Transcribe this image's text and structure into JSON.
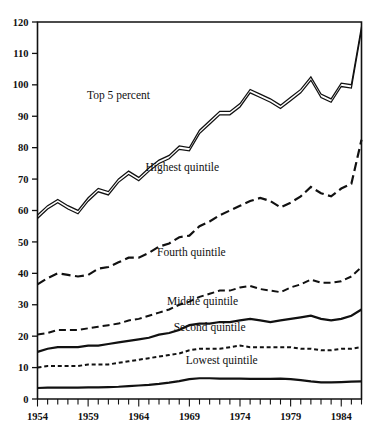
{
  "chart_data": {
    "type": "line",
    "title": "",
    "subtitle": "",
    "xlabel": "",
    "ylabel": "",
    "xlim": [
      1954,
      1986
    ],
    "ylim": [
      0,
      120
    ],
    "ytick_values": [
      0,
      10,
      20,
      30,
      40,
      50,
      60,
      70,
      80,
      90,
      100,
      110,
      120
    ],
    "ytick_labels": [
      "0",
      "10",
      "20",
      "30",
      "40",
      "50",
      "60",
      "70",
      "80",
      "90",
      "100",
      "110",
      "120"
    ],
    "xtick_values": [
      1954,
      1959,
      1964,
      1969,
      1974,
      1979,
      1984
    ],
    "xtick_labels": [
      "1954",
      "1959",
      "1964",
      "1969",
      "1974",
      "1979",
      "1984"
    ],
    "xtick_minor_every": 1,
    "grid": false,
    "legend_position": "inline-annotations",
    "x": [
      1954,
      1955,
      1956,
      1957,
      1958,
      1959,
      1960,
      1961,
      1962,
      1963,
      1964,
      1965,
      1966,
      1967,
      1968,
      1969,
      1970,
      1971,
      1972,
      1973,
      1974,
      1975,
      1976,
      1977,
      1978,
      1979,
      1980,
      1981,
      1982,
      1983,
      1984,
      1985,
      1986
    ],
    "series": [
      {
        "name": "Top 5 percent",
        "style": "double-solid",
        "label_x": 1962.0,
        "label_y": 95.5,
        "values": [
          58.0,
          61.0,
          63.0,
          61.0,
          59.5,
          63.5,
          66.5,
          65.5,
          69.5,
          72.0,
          70.0,
          73.0,
          75.5,
          77.0,
          80.0,
          79.5,
          85.0,
          88.0,
          91.0,
          91.0,
          93.5,
          98.0,
          96.5,
          95.0,
          93.0,
          95.5,
          98.0,
          102.0,
          96.5,
          95.0,
          100.0,
          99.5,
          118.0
        ]
      },
      {
        "name": "Highest quintile",
        "style": "long-dash",
        "label_x": 1968.3,
        "label_y": 72.5,
        "values": [
          36.5,
          38.5,
          40.0,
          39.5,
          39.0,
          39.5,
          41.5,
          42.0,
          43.5,
          45.0,
          45.0,
          46.5,
          48.5,
          49.5,
          51.5,
          52.0,
          55.0,
          56.5,
          58.5,
          60.0,
          61.5,
          63.0,
          64.0,
          63.0,
          61.0,
          62.5,
          64.5,
          67.5,
          65.5,
          64.5,
          67.0,
          68.5,
          82.5
        ]
      },
      {
        "name": "Fourth quintile",
        "style": "medium-dash",
        "label_x": 1969.2,
        "label_y": 45.5,
        "values": [
          20.5,
          21.0,
          22.0,
          22.0,
          22.0,
          22.5,
          23.0,
          23.5,
          24.0,
          25.0,
          25.5,
          26.5,
          27.5,
          28.5,
          30.0,
          31.0,
          32.5,
          33.5,
          34.5,
          34.5,
          35.5,
          36.0,
          35.0,
          34.5,
          34.0,
          35.5,
          36.5,
          38.0,
          37.0,
          37.0,
          37.5,
          39.0,
          42.0
        ]
      },
      {
        "name": "Middle quintile",
        "style": "solid",
        "label_x": 1970.3,
        "label_y": 30.0,
        "values": [
          15.0,
          16.0,
          16.5,
          16.5,
          16.5,
          17.0,
          17.0,
          17.5,
          18.0,
          18.5,
          19.0,
          19.5,
          20.5,
          21.0,
          22.0,
          23.5,
          24.0,
          24.0,
          24.5,
          24.5,
          25.0,
          25.5,
          25.0,
          24.5,
          25.0,
          25.5,
          26.0,
          26.5,
          25.5,
          25.0,
          25.5,
          26.5,
          28.5
        ]
      },
      {
        "name": "Second quintile",
        "style": "short-dash",
        "label_x": 1971.0,
        "label_y": 21.5,
        "values": [
          10.0,
          10.5,
          10.5,
          10.5,
          10.5,
          11.0,
          11.0,
          11.0,
          11.5,
          12.0,
          12.5,
          13.0,
          13.5,
          14.0,
          14.5,
          15.5,
          16.0,
          16.0,
          16.0,
          16.5,
          17.0,
          16.5,
          16.5,
          16.5,
          16.5,
          16.5,
          16.0,
          16.0,
          15.5,
          15.5,
          16.0,
          16.0,
          16.5
        ]
      },
      {
        "name": "Lowest quintile",
        "style": "solid",
        "label_x": 1972.2,
        "label_y": 11.0,
        "values": [
          3.5,
          3.6,
          3.6,
          3.6,
          3.6,
          3.7,
          3.7,
          3.8,
          3.9,
          4.1,
          4.3,
          4.5,
          4.8,
          5.2,
          5.7,
          6.3,
          6.6,
          6.6,
          6.5,
          6.5,
          6.5,
          6.4,
          6.4,
          6.4,
          6.5,
          6.3,
          6.0,
          5.6,
          5.3,
          5.3,
          5.4,
          5.5,
          5.6
        ]
      }
    ]
  },
  "axis": {
    "top_value_label": "120",
    "bottom_value_label": "0"
  }
}
